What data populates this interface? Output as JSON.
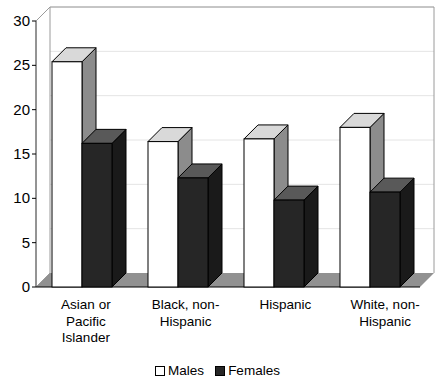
{
  "chart_data": {
    "type": "bar",
    "title": "",
    "subtitle": "",
    "xlabel": "",
    "ylabel": "",
    "ylim": [
      0,
      30
    ],
    "yticks": [
      0,
      5,
      10,
      15,
      20,
      25,
      30
    ],
    "ytick_labels": [
      "0",
      "5",
      "10",
      "15",
      "20",
      "25",
      "30"
    ],
    "grid": true,
    "grid_axis": "y",
    "legend_position": "bottom-center",
    "style": "3d-column",
    "categories": [
      "Asian or Pacific Islander",
      "Black, non-Hispanic",
      "Hispanic",
      "White, non-Hispanic"
    ],
    "category_lines": [
      [
        "Asian or",
        "Pacific",
        "Islander"
      ],
      [
        "Black, non-",
        "Hispanic"
      ],
      [
        "Hispanic"
      ],
      [
        "White, non-",
        "Hispanic"
      ]
    ],
    "series": [
      {
        "name": "Males",
        "color": "#ffffff",
        "values": [
          25.4,
          16.4,
          16.7,
          18.0
        ]
      },
      {
        "name": "Females",
        "color": "#262626",
        "values": [
          16.2,
          12.3,
          9.8,
          10.7
        ]
      }
    ]
  },
  "legend": {
    "items": [
      {
        "label": "Males",
        "swatch": "white-square-swatch"
      },
      {
        "label": "Females",
        "swatch": "black-square-swatch"
      }
    ]
  },
  "axis": {
    "y_tick_labels": [
      "30",
      "25",
      "20",
      "15",
      "10",
      "5",
      "0"
    ]
  },
  "colors": {
    "bar_males_front": "#ffffff",
    "bar_males_top": "#d9d9d9",
    "bar_males_side": "#8c8c8c",
    "bar_females_front": "#262626",
    "bar_females_top": "#595959",
    "bar_females_side": "#1a1a1a",
    "floor": "#919191",
    "wall": "#ffffff",
    "gridline": "#e4e4e4",
    "outline": "#000000"
  }
}
